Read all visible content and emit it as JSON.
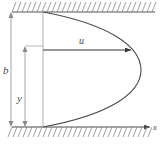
{
  "figure": {
    "type": "technical-diagram",
    "colors": {
      "wall_line": "#555555",
      "hatch_line": "#777777",
      "profile_curve": "#4a4a4a",
      "dimension_line": "#9a9a9a",
      "velocity_arrow": "#333333",
      "axis_line": "#4a4a4a",
      "label_text": "#4a4a4a",
      "background": "#ffffff"
    },
    "labels": {
      "channel_width": "b",
      "vertical_position": "y",
      "velocity": "u",
      "x_axis": "x"
    },
    "geometry": {
      "top_wall_y": 12,
      "bottom_wall_y": 127,
      "wall_x_start": 12,
      "wall_x_end": 155,
      "profile_root_x": 43,
      "profile_apex_x": 141,
      "profile_apex_y": 70,
      "b_arrow_x": 11,
      "y_arrow_x": 25,
      "y_arrow_top": 46,
      "u_arrow_y": 50,
      "u_arrow_x_start": 43,
      "u_arrow_x_end": 133,
      "x_axis_y": 127,
      "x_axis_x_end": 150
    }
  }
}
